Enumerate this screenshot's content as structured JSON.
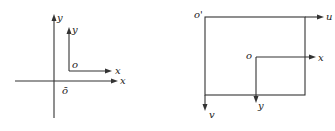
{
  "left_diagram": {
    "outer_axes": {
      "x_label": "x",
      "y_label": "y",
      "origin_label": "ō"
    },
    "inner_axes": {
      "x_label": "x",
      "y_label": "y",
      "origin_label": "o"
    }
  },
  "right_diagram": {
    "image_frame": {
      "origin_label": "o'",
      "u_label": "u",
      "v_label": "v"
    },
    "inner_axes": {
      "origin_label": "o",
      "x_label": "x",
      "y_label": "y"
    }
  },
  "colors": {
    "line": "#333333",
    "text": "#222222",
    "background": "#ffffff"
  }
}
